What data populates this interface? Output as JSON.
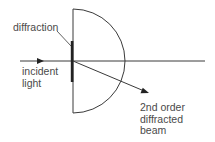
{
  "diagram": {
    "labels": {
      "grating": "diffraction",
      "incident": [
        "incident",
        "light"
      ],
      "diffracted": [
        "2nd order",
        "diffracted",
        "beam"
      ]
    },
    "colors": {
      "line": "#3a3a3a",
      "grating": "#222222",
      "text": "#4a4a4a"
    },
    "geometry": {
      "semicircle_center": [
        73,
        61
      ],
      "semicircle_radius": 52,
      "axis_start_x": 20,
      "axis_end_x": 205,
      "grating_x": 72,
      "grating_y": [
        41,
        82
      ],
      "diffracted_tip": [
        149,
        93
      ]
    }
  }
}
